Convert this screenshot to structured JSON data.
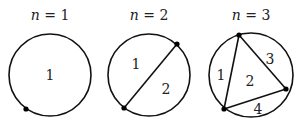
{
  "panels": [
    {
      "n_label": "n",
      "eq": " = ",
      "n_value": "1",
      "circle": {
        "cx": 50,
        "cy": 75,
        "r": 41
      },
      "points": [
        [
          26,
          109
        ]
      ],
      "chords": [],
      "regions": [
        {
          "label": "1",
          "x": 50,
          "y": 80
        }
      ]
    },
    {
      "n_label": "n",
      "eq": " = ",
      "n_value": "2",
      "circle": {
        "cx": 149,
        "cy": 75,
        "r": 41
      },
      "points": [
        [
          177,
          44
        ],
        [
          124,
          108
        ]
      ],
      "chords": [
        [
          0,
          1
        ]
      ],
      "regions": [
        {
          "label": "1",
          "x": 136,
          "y": 69
        },
        {
          "label": "2",
          "x": 166,
          "y": 94
        }
      ]
    },
    {
      "n_label": "n",
      "eq": " = ",
      "n_value": "3",
      "circle": {
        "cx": 251,
        "cy": 75,
        "r": 42
      },
      "points": [
        [
          239,
          35
        ],
        [
          286,
          89
        ],
        [
          224,
          109
        ]
      ],
      "chords": [
        [
          0,
          1
        ],
        [
          1,
          2
        ],
        [
          2,
          0
        ]
      ],
      "regions": [
        {
          "label": "1",
          "x": 221,
          "y": 75
        },
        {
          "label": "2",
          "x": 250,
          "y": 81
        },
        {
          "label": "3",
          "x": 270,
          "y": 59
        },
        {
          "label": "4",
          "x": 258,
          "y": 112
        }
      ]
    }
  ]
}
